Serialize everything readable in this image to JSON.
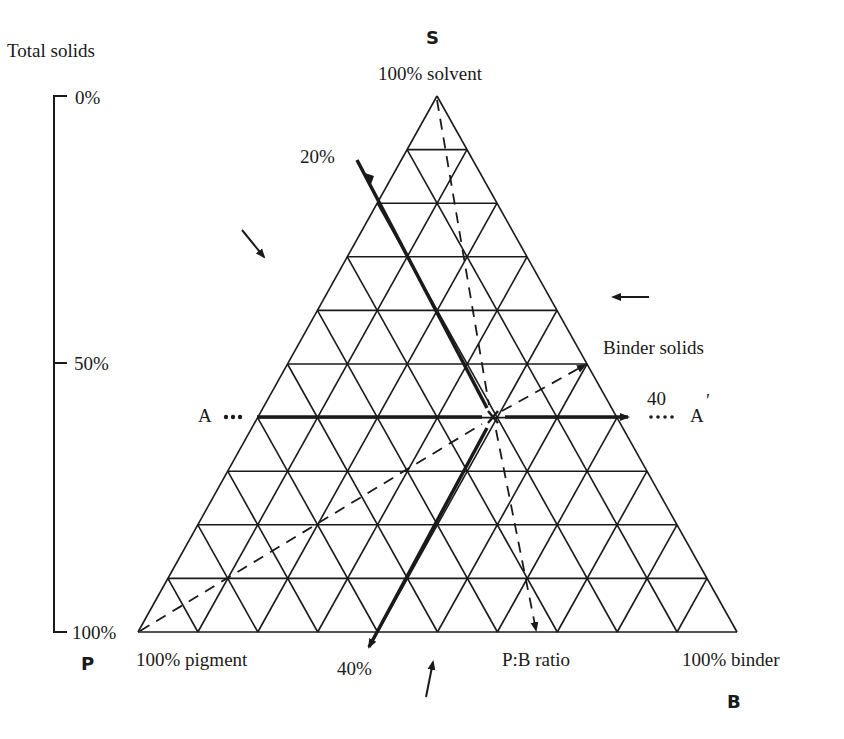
{
  "diagram": {
    "type": "ternary",
    "vertices": {
      "top": {
        "letter": "S",
        "label": "100% solvent"
      },
      "bottom_left": {
        "letter": "P",
        "label": "100% pigment"
      },
      "bottom_right": {
        "letter": "B",
        "label": "100% binder"
      }
    },
    "subdivisions": 10,
    "total_solids_axis": {
      "title": "Total solids",
      "ticks": [
        {
          "label": "0%",
          "value": 0
        },
        {
          "label": "50%",
          "value": 50
        },
        {
          "label": "100%",
          "value": 100
        }
      ]
    },
    "annotations": {
      "pigment_line_label": "20%",
      "pigment_line_bottom_label": "40%",
      "binder_solids_label": "Binder solids",
      "binder_value_label": "40",
      "line_a_left": "A",
      "line_a_right": "A",
      "line_a_right_prime": "′",
      "pb_ratio_label": "P:B ratio",
      "point_marker": "x"
    },
    "point_x": {
      "solvent_row": 6,
      "total_solids_pct": 60,
      "binder_solids_pct": 40
    },
    "colors": {
      "ink": "#1a1a1a",
      "background": "#ffffff"
    }
  }
}
